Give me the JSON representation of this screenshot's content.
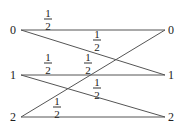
{
  "diagram": {
    "left_nodes": [
      {
        "label": "0",
        "x": 10,
        "y": 24
      },
      {
        "label": "1",
        "x": 10,
        "y": 69
      },
      {
        "label": "2",
        "x": 10,
        "y": 111
      }
    ],
    "right_nodes": [
      {
        "label": "0",
        "x": 168,
        "y": 24
      },
      {
        "label": "1",
        "x": 168,
        "y": 69
      },
      {
        "label": "2",
        "x": 168,
        "y": 111
      }
    ],
    "edges": [
      {
        "from": "0",
        "to": "0",
        "x1": 21,
        "y1": 30,
        "x2": 165,
        "y2": 30
      },
      {
        "from": "0",
        "to": "1",
        "x1": 21,
        "y1": 30,
        "x2": 165,
        "y2": 75
      },
      {
        "from": "1",
        "to": "1",
        "x1": 21,
        "y1": 75,
        "x2": 165,
        "y2": 75
      },
      {
        "from": "1",
        "to": "2",
        "x1": 21,
        "y1": 75,
        "x2": 165,
        "y2": 117
      },
      {
        "from": "2",
        "to": "2",
        "x1": 21,
        "y1": 117,
        "x2": 165,
        "y2": 117
      },
      {
        "from": "2",
        "to": "0",
        "x1": 21,
        "y1": 117,
        "x2": 165,
        "y2": 30
      }
    ],
    "weights": [
      {
        "num": "1",
        "den": "2",
        "x": 48,
        "y": 19
      },
      {
        "num": "1",
        "den": "2",
        "x": 97,
        "y": 40
      },
      {
        "num": "1",
        "den": "2",
        "x": 48,
        "y": 63
      },
      {
        "num": "1",
        "den": "2",
        "x": 88,
        "y": 63
      },
      {
        "num": "1",
        "den": "2",
        "x": 97,
        "y": 88
      },
      {
        "num": "1",
        "den": "2",
        "x": 57,
        "y": 107
      }
    ],
    "line_color": "#555555"
  }
}
